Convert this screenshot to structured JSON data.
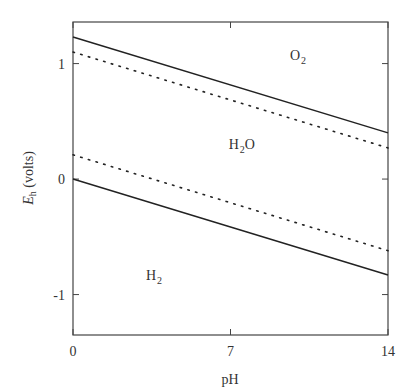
{
  "chart_data": {
    "type": "line",
    "title": "",
    "xlabel": "pH",
    "ylabel_main": "E",
    "ylabel_sub": "h",
    "ylabel_rest": " (volts)",
    "xlim": [
      0,
      14
    ],
    "ylim": [
      -1.35,
      1.36
    ],
    "grid": false,
    "legend": "none",
    "x_ticks": [
      {
        "value": 0,
        "label": "0"
      },
      {
        "value": 7,
        "label": "7"
      },
      {
        "value": 14,
        "label": "14"
      }
    ],
    "y_ticks": [
      {
        "value": 1,
        "label": "1"
      },
      {
        "value": 0,
        "label": "0"
      },
      {
        "value": -1,
        "label": "-1"
      }
    ],
    "series": [
      {
        "name": "O2/H2O boundary (theoretical)",
        "style": "solid",
        "x": [
          0,
          14
        ],
        "y": [
          1.23,
          0.4
        ]
      },
      {
        "name": "O2/H2O boundary (practical)",
        "style": "dotted",
        "x": [
          0,
          14
        ],
        "y": [
          1.1,
          0.27
        ]
      },
      {
        "name": "H2O/H2 boundary (practical)",
        "style": "dotted",
        "x": [
          0,
          14
        ],
        "y": [
          0.21,
          -0.62
        ]
      },
      {
        "name": "H2O/H2 boundary (theoretical)",
        "style": "solid",
        "x": [
          0,
          14
        ],
        "y": [
          0.0,
          -0.83
        ]
      }
    ],
    "annotations": [
      {
        "main": "O",
        "sub": "2",
        "rest": "",
        "x": 10.0,
        "y": 1.03
      },
      {
        "main": "H",
        "sub": "2",
        "rest": "O",
        "x": 7.5,
        "y": 0.26
      },
      {
        "main": "H",
        "sub": "2",
        "rest": "",
        "x": 3.6,
        "y": -0.87
      }
    ]
  }
}
